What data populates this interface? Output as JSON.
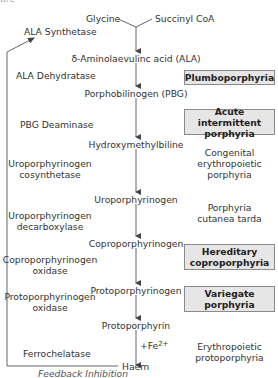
{
  "diagram": {
    "precursors": [
      "Glycine",
      "Succinyl CoA"
    ],
    "pathway": [
      "δ-Aminolaevulinc acid (ALA)",
      "Porphobilinogen (PBG)",
      "Hydroxymethylbiline",
      "Uroporphyrinogen",
      "Coproporphyrinogen",
      "Protoporphyrinogen",
      "Protoporphyrin",
      "Haem"
    ],
    "enzymes": [
      "ALA Synthetase",
      "ALA Dehydratase",
      "PBG Deaminase",
      [
        "Uroporphyrinogen",
        "cosynthetase"
      ],
      [
        "Uroporphyrinogen",
        "decarboxylase"
      ],
      [
        "Coproporphyrinogen",
        "oxidase"
      ],
      [
        "Protoporphyrinogen",
        "oxidase"
      ],
      "Ferrochelatase"
    ],
    "iron_label": "+Fe",
    "iron_charge": "2+",
    "feedback_label": "Feedback Inhibition",
    "porphyrias": [
      {
        "lines": [
          "Plumboporphyria"
        ],
        "acute": true
      },
      {
        "lines": [
          "Acute intermittent",
          "porphyria"
        ],
        "acute": true
      },
      {
        "lines": [
          "Congenital",
          "erythropoietic",
          "porphyria"
        ],
        "acute": false
      },
      {
        "lines": [
          "Porphyria",
          "cutanea tarda"
        ],
        "acute": false
      },
      {
        "lines": [
          "Hereditary",
          "coproporphyria"
        ],
        "acute": true
      },
      {
        "lines": [
          "Variegate",
          "porphyria"
        ],
        "acute": true
      },
      {
        "lines": [
          "Erythropoietic",
          "protoporphyria"
        ],
        "acute": false
      }
    ],
    "colors": {
      "acute_fill": "#e6e6e6",
      "acute_border": "#8a8a8a",
      "line": "#555555",
      "text": "#333333"
    }
  }
}
